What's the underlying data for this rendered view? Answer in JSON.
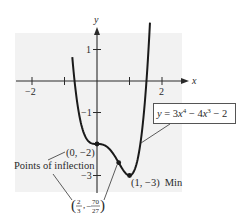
{
  "chart_data": {
    "type": "line",
    "title": "",
    "xlabel": "x",
    "ylabel": "y",
    "function": {
      "label": "y = 3x⁴ − 4x³ − 2",
      "coefficients": {
        "x4": 3,
        "x3": -4,
        "x2": 0,
        "x1": 0,
        "x0": -2
      },
      "x_range": [
        -0.76,
        1.63
      ]
    },
    "xlim": [
      -2.5,
      2.6
    ],
    "ylim": [
      -3.5,
      1.5
    ],
    "x_ticks": [
      {
        "value": -2,
        "label": "−2"
      },
      {
        "value": -1,
        "label": ""
      },
      {
        "value": 1,
        "label": ""
      },
      {
        "value": 2,
        "label": "2"
      }
    ],
    "y_ticks": [
      {
        "value": 1,
        "label": "1"
      },
      {
        "value": -1,
        "label": "−1"
      },
      {
        "value": -3,
        "label": "−3"
      }
    ],
    "points": [
      {
        "x": 0,
        "y": -2,
        "label": "(0, −2)",
        "kind": "inflection"
      },
      {
        "x": 0.6667,
        "y": -2.5926,
        "label": "(2/3, −70/27)",
        "kind": "inflection"
      },
      {
        "x": 1,
        "y": -3,
        "label": "(1, −3) Min",
        "kind": "minimum"
      }
    ],
    "annotations": [
      "Points of inflection",
      "(0, −2)",
      "(2/3, −70/27)",
      "(1, −3) Min",
      "y = 3x⁴ − 4x³ − 2"
    ],
    "grid": false,
    "legend": "none"
  },
  "labels": {
    "axis_x": "x",
    "axis_y": "y",
    "tick_x_neg2": "−2",
    "tick_x_2": "2",
    "tick_y_1": "1",
    "tick_y_neg1": "−1",
    "tick_y_neg3": "−3",
    "equation": {
      "y": "y",
      "eq": " = 3",
      "x1": "x",
      "exp4": "4",
      "minus": " − 4",
      "x2": "x",
      "exp3": "3",
      "tail": " − 2"
    },
    "inflection_title": "Points of inflection",
    "point_0_neg2": "(0, −2)",
    "frac_num_x": "2",
    "frac_den_x": "3",
    "frac_num_y": "70",
    "frac_den_y": "27",
    "frac_neg": "−",
    "min_label": "(1, −3)",
    "min_word": "Min"
  },
  "colors": {
    "panel": "#f2f2f2",
    "curve": "#1a1a1a",
    "axis": "#2a2a2a",
    "box_border": "#555555"
  }
}
